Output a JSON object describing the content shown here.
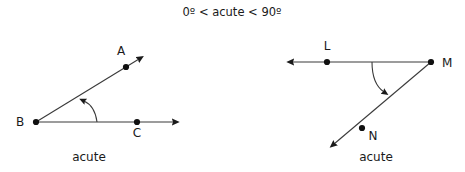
{
  "figure": {
    "title": "0º < acute < 90º",
    "background_color": "#ffffff",
    "stroke_color": "#1a1a1a",
    "text_color": "#1a1a1a"
  },
  "diagrams": [
    {
      "id": "left-angle",
      "caption": "acute",
      "vertex_label": "B",
      "labels": {
        "a": "A",
        "b": "B",
        "c": "C"
      },
      "angle_arc": {
        "marker": "arrowhead",
        "direction": "counterclockwise"
      },
      "rays": [
        {
          "name": "ray-BA",
          "from": "B",
          "through": "A",
          "arrow": "end"
        },
        {
          "name": "ray-BC",
          "from": "B",
          "through": "C",
          "arrow": "end"
        }
      ]
    },
    {
      "id": "right-angle",
      "caption": "acute",
      "vertex_label": "M",
      "labels": {
        "l": "L",
        "m": "M",
        "n": "N"
      },
      "angle_arc": {
        "marker": "arrowhead",
        "direction": "clockwise"
      },
      "rays": [
        {
          "name": "ray-ML",
          "from": "M",
          "through": "L",
          "arrow": "end"
        },
        {
          "name": "ray-MN",
          "from": "M",
          "through": "N",
          "arrow": "end"
        }
      ]
    }
  ]
}
